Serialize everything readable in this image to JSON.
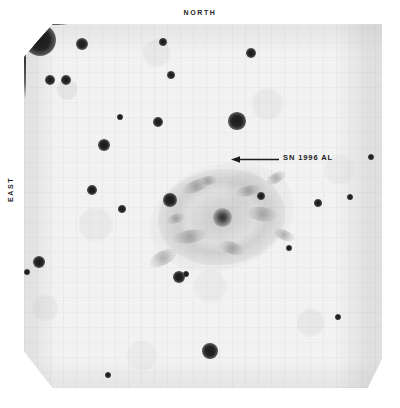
{
  "figure": {
    "kind": "astronomical-photographic-plate",
    "background_color": "#f2f2f2",
    "ink_color": "#1b1b1b"
  },
  "orientation": {
    "north_label": "NORTH",
    "east_label": "EAST"
  },
  "annotation": {
    "sn_label": "SN 1996 AL",
    "arrow_direction": "left",
    "arrow_color": "#1b1b1b",
    "points_to": "supernova star"
  },
  "objects": {
    "galaxy": {
      "name": "host galaxy",
      "center_x": 222,
      "center_y": 217,
      "halo_width": 148,
      "halo_height": 104,
      "rotation_deg": -18,
      "core_size": 19
    },
    "supernova": {
      "center_x": 218,
      "center_y": 160,
      "size": 11
    },
    "bright_star": {
      "center_x": 64,
      "center_y": 258,
      "size": 17,
      "has_diffraction_spikes": true
    },
    "field_stars": [
      {
        "x": 82,
        "y": 44,
        "size": 6
      },
      {
        "x": 163,
        "y": 42,
        "size": 4
      },
      {
        "x": 50,
        "y": 80,
        "size": 5
      },
      {
        "x": 66,
        "y": 80,
        "size": 5
      },
      {
        "x": 171,
        "y": 75,
        "size": 4
      },
      {
        "x": 251,
        "y": 53,
        "size": 5
      },
      {
        "x": 158,
        "y": 122,
        "size": 5
      },
      {
        "x": 237,
        "y": 121,
        "size": 9
      },
      {
        "x": 104,
        "y": 145,
        "size": 6
      },
      {
        "x": 120,
        "y": 117,
        "size": 3
      },
      {
        "x": 122,
        "y": 209,
        "size": 4
      },
      {
        "x": 92,
        "y": 190,
        "size": 5
      },
      {
        "x": 170,
        "y": 200,
        "size": 7
      },
      {
        "x": 261,
        "y": 196,
        "size": 4
      },
      {
        "x": 39,
        "y": 262,
        "size": 6
      },
      {
        "x": 27,
        "y": 272,
        "size": 3
      },
      {
        "x": 179,
        "y": 277,
        "size": 6
      },
      {
        "x": 186,
        "y": 274,
        "size": 3
      },
      {
        "x": 210,
        "y": 351,
        "size": 8
      },
      {
        "x": 318,
        "y": 203,
        "size": 4
      },
      {
        "x": 371,
        "y": 157,
        "size": 3
      },
      {
        "x": 350,
        "y": 197,
        "size": 3
      },
      {
        "x": 338,
        "y": 317,
        "size": 3
      },
      {
        "x": 289,
        "y": 248,
        "size": 3
      },
      {
        "x": 108,
        "y": 375,
        "size": 3
      },
      {
        "x": 194,
        "y": 392,
        "size": 3
      }
    ],
    "galaxy_knots": [
      {
        "x": 196,
        "y": 186,
        "w": 30,
        "h": 12,
        "rot": -22
      },
      {
        "x": 248,
        "y": 191,
        "w": 26,
        "h": 10,
        "rot": -14
      },
      {
        "x": 262,
        "y": 214,
        "w": 30,
        "h": 14,
        "rot": 8
      },
      {
        "x": 190,
        "y": 236,
        "w": 34,
        "h": 13,
        "rot": -10
      },
      {
        "x": 232,
        "y": 248,
        "w": 26,
        "h": 12,
        "rot": 18
      },
      {
        "x": 163,
        "y": 258,
        "w": 30,
        "h": 14,
        "rot": -28
      },
      {
        "x": 276,
        "y": 178,
        "w": 22,
        "h": 10,
        "rot": -30
      },
      {
        "x": 208,
        "y": 180,
        "w": 18,
        "h": 9,
        "rot": -6
      },
      {
        "x": 284,
        "y": 235,
        "w": 22,
        "h": 10,
        "rot": 22
      },
      {
        "x": 176,
        "y": 218,
        "w": 20,
        "h": 9,
        "rot": -18
      }
    ]
  }
}
